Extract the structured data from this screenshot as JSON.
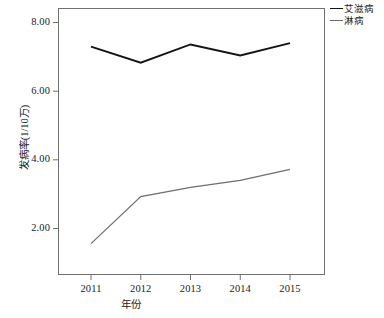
{
  "chart_data": {
    "type": "line",
    "title": "",
    "xlabel": "年份",
    "ylabel": "发病率(1/10万)",
    "categories": [
      "2011",
      "2012",
      "2013",
      "2014",
      "2015"
    ],
    "x": [
      2011,
      2012,
      2013,
      2014,
      2015
    ],
    "xlim": [
      2010.6,
      2015.4
    ],
    "ylim": [
      0.9,
      8.4
    ],
    "yticks": [
      "2.00",
      "4.00",
      "6.00",
      "8.00"
    ],
    "ytick_values": [
      2.0,
      4.0,
      6.0,
      8.0
    ],
    "grid": false,
    "legend_position": "top-right-outside",
    "series": [
      {
        "name": "艾滋病",
        "color": "#141414",
        "width": 1.9,
        "values": [
          7.3,
          6.83,
          7.36,
          7.04,
          7.4
        ]
      },
      {
        "name": "淋病",
        "color": "#6e6e6e",
        "width": 1.2,
        "values": [
          1.56,
          2.93,
          3.2,
          3.4,
          3.72
        ]
      }
    ]
  },
  "axes": {
    "frame_color": "#707070",
    "tick_color": "#707070"
  },
  "legend": {
    "items": [
      {
        "label": "艾滋病",
        "color": "#141414"
      },
      {
        "label": "淋病",
        "color": "#6e6e6e"
      }
    ]
  }
}
